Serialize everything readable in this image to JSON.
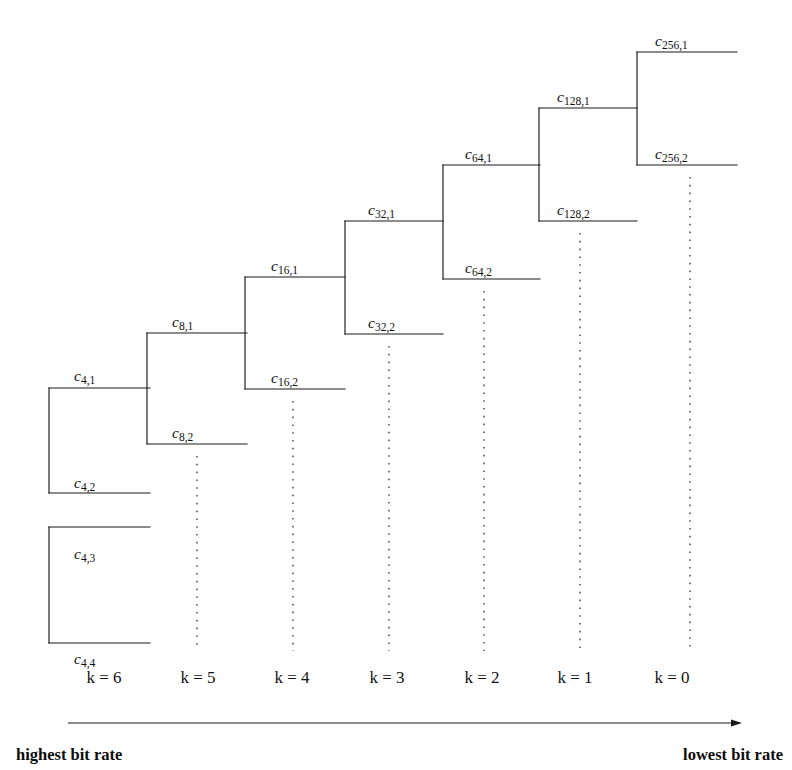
{
  "figure": {
    "background_color": "#ffffff",
    "line_color": "#1a1a1a",
    "dotted_color": "#2b2b2b"
  },
  "levels": [
    {
      "k": 6,
      "k_label": "k = 6",
      "k_label_x": 104,
      "trunk_x": 49,
      "upper_y": 388,
      "lower_y": 493,
      "branch_end_x": 150,
      "upper_label": "c",
      "upper_sub": "4,1",
      "lower_label": "c",
      "lower_sub": "4,2",
      "upper_label_x": 74,
      "upper_label_y": 381,
      "lower_label_x": 74,
      "lower_label_y": 488,
      "dotted_x": null,
      "dotted_y1": null,
      "dotted_y2": null
    },
    {
      "k": 5,
      "k_label": "k = 5",
      "k_label_x": 198,
      "trunk_x": 147,
      "upper_y": 333,
      "lower_y": 444,
      "branch_end_x": 247,
      "upper_label": "c",
      "upper_sub": "8,1",
      "lower_label": "c",
      "lower_sub": "8,2",
      "upper_label_x": 172,
      "upper_label_y": 327,
      "lower_label_x": 172,
      "lower_label_y": 438,
      "dotted_x": 197,
      "dotted_y1": 456,
      "dotted_y2": 651
    },
    {
      "k": 4,
      "k_label": "k = 4",
      "k_label_x": 292,
      "trunk_x": 245,
      "upper_y": 277,
      "lower_y": 389,
      "branch_end_x": 345,
      "upper_label": "c",
      "upper_sub": "16,1",
      "lower_label": "c",
      "lower_sub": "16,2",
      "upper_label_x": 271,
      "upper_label_y": 271,
      "lower_label_x": 271,
      "lower_label_y": 383,
      "dotted_x": 293,
      "dotted_y1": 401,
      "dotted_y2": 651
    },
    {
      "k": 3,
      "k_label": "k = 3",
      "k_label_x": 387,
      "trunk_x": 345,
      "upper_y": 221,
      "lower_y": 334,
      "branch_end_x": 443,
      "upper_label": "c",
      "upper_sub": "32,1",
      "lower_label": "c",
      "lower_sub": "32,2",
      "upper_label_x": 368,
      "upper_label_y": 215,
      "lower_label_x": 368,
      "lower_label_y": 328,
      "dotted_x": 389,
      "dotted_y1": 346,
      "dotted_y2": 651
    },
    {
      "k": 2,
      "k_label": "k = 2",
      "k_label_x": 482,
      "trunk_x": 443,
      "upper_y": 165,
      "lower_y": 279,
      "branch_end_x": 540,
      "upper_label": "c",
      "upper_sub": "64,1",
      "lower_label": "c",
      "lower_sub": "64,2",
      "upper_label_x": 465,
      "upper_label_y": 159,
      "lower_label_x": 465,
      "lower_label_y": 273,
      "dotted_x": 484,
      "dotted_y1": 291,
      "dotted_y2": 651
    },
    {
      "k": 1,
      "k_label": "k = 1",
      "k_label_x": 575,
      "trunk_x": 539,
      "upper_y": 108,
      "lower_y": 221,
      "branch_end_x": 637,
      "upper_label": "c",
      "upper_sub": "128,1",
      "lower_label": "c",
      "lower_sub": "128,2",
      "upper_label_x": 557,
      "upper_label_y": 102,
      "lower_label_x": 557,
      "lower_label_y": 215,
      "dotted_x": 580,
      "dotted_y1": 233,
      "dotted_y2": 651
    },
    {
      "k": 0,
      "k_label": "k = 0",
      "k_label_x": 672,
      "trunk_x": 637,
      "upper_y": 52,
      "lower_y": 165,
      "branch_end_x": 737,
      "upper_label": "c",
      "upper_sub": "256,1",
      "lower_label": "c",
      "lower_sub": "256,2",
      "upper_label_x": 655,
      "upper_label_y": 46,
      "lower_label_x": 655,
      "lower_label_y": 159,
      "dotted_x": 690,
      "dotted_y1": 177,
      "dotted_y2": 651
    }
  ],
  "extra_box": {
    "name": "c4-3-c4-4-box",
    "trunk_x": 49,
    "top_y": 527,
    "bottom_y": 643,
    "right_x": 150,
    "top_label": "c",
    "top_sub": "4,3",
    "bottom_label": "c",
    "bottom_sub": "4,4",
    "top_label_x": 74,
    "top_label_y": 559,
    "bottom_label_x": 74,
    "bottom_label_y": 664
  },
  "axis": {
    "line_x1": 68,
    "line_x2": 742,
    "line_y": 723,
    "left_label": "highest bit rate",
    "right_label": "lowest bit rate",
    "left_label_x": 16,
    "right_label_x": 783,
    "label_y": 760
  }
}
